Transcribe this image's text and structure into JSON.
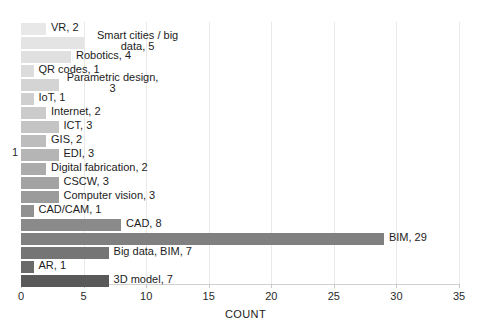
{
  "chart_data": {
    "type": "bar",
    "orientation": "horizontal",
    "title": "",
    "xlabel": "COUNT",
    "ylabel": "",
    "xlim": [
      0,
      35
    ],
    "xticks": [
      0,
      5,
      10,
      15,
      20,
      25,
      30,
      35
    ],
    "yticks_visible": [
      "1"
    ],
    "grid": true,
    "legend": false,
    "categories": [
      "VR",
      "Smart cities / big data",
      "Robotics",
      "QR codes",
      "Parametric design",
      "IoT",
      "Internet",
      "ICT",
      "GIS",
      "EDI",
      "Digital fabrication",
      "CSCW",
      "Computer vision",
      "CAD/CAM",
      "CAD",
      "BIM",
      "Big data, BIM",
      "AR",
      "3D model"
    ],
    "values": [
      2,
      5,
      4,
      1,
      3,
      1,
      2,
      3,
      2,
      3,
      2,
      3,
      3,
      1,
      8,
      29,
      7,
      1,
      7
    ],
    "bars": [
      {
        "label": "VR, 2",
        "value": 2,
        "color": "#e8e8e8",
        "two_line": false
      },
      {
        "label": "Smart cities / big data, 5",
        "value": 5,
        "color": "#e4e4e4",
        "two_line": true
      },
      {
        "label": "Robotics, 4",
        "value": 4,
        "color": "#e0e0e0",
        "two_line": false
      },
      {
        "label": "QR codes, 1",
        "value": 1,
        "color": "#dcdcdc",
        "two_line": false
      },
      {
        "label": "Parametric design, 3",
        "value": 3,
        "color": "#d4d4d4",
        "two_line": true
      },
      {
        "label": "IoT, 1",
        "value": 1,
        "color": "#cfcfcf",
        "two_line": false
      },
      {
        "label": "Internet, 2",
        "value": 2,
        "color": "#cbcbcb",
        "two_line": false
      },
      {
        "label": "ICT, 3",
        "value": 3,
        "color": "#c4c4c4",
        "two_line": false
      },
      {
        "label": "GIS, 2",
        "value": 2,
        "color": "#bdbdbd",
        "two_line": false
      },
      {
        "label": "EDI, 3",
        "value": 3,
        "color": "#b5b5b5",
        "two_line": false
      },
      {
        "label": "Digital fabrication, 2",
        "value": 2,
        "color": "#ababab",
        "two_line": false
      },
      {
        "label": "CSCW, 3",
        "value": 3,
        "color": "#a3a3a3",
        "two_line": false
      },
      {
        "label": "Computer vision, 3",
        "value": 3,
        "color": "#9b9b9b",
        "two_line": false
      },
      {
        "label": "CAD/CAM, 1",
        "value": 1,
        "color": "#919191",
        "two_line": false
      },
      {
        "label": "CAD, 8",
        "value": 8,
        "color": "#8a8a8a",
        "two_line": false
      },
      {
        "label": "BIM, 29",
        "value": 29,
        "color": "#808080",
        "two_line": false
      },
      {
        "label": "Big data, BIM, 7",
        "value": 7,
        "color": "#757575",
        "two_line": false
      },
      {
        "label": "AR, 1",
        "value": 1,
        "color": "#6a6a6a",
        "two_line": false
      },
      {
        "label": "3D model, 7",
        "value": 7,
        "color": "#595959",
        "two_line": false
      }
    ]
  }
}
